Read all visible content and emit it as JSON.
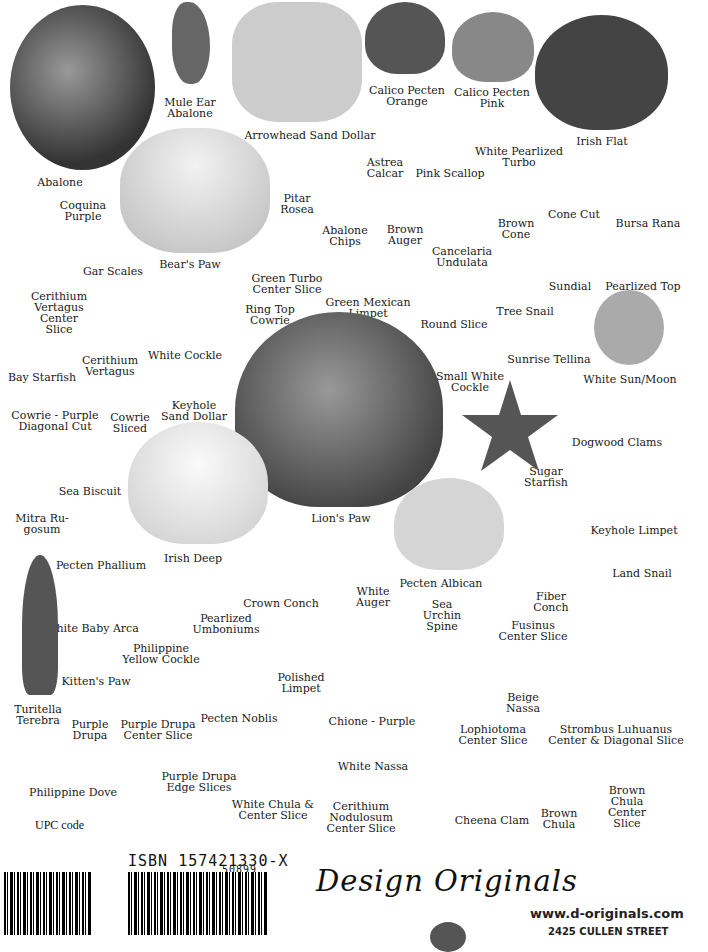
{
  "shells": [
    {
      "label": "Abalone",
      "x": 60,
      "y": 177
    },
    {
      "label": "Mule Ear\nAbalone",
      "x": 190,
      "y": 97
    },
    {
      "label": "Arrowhead Sand Dollar",
      "x": 310,
      "y": 130
    },
    {
      "label": "Calico Pecten\nOrange",
      "x": 407,
      "y": 85
    },
    {
      "label": "Calico Pecten\nPink",
      "x": 492,
      "y": 87
    },
    {
      "label": "Irish Flat",
      "x": 602,
      "y": 136
    },
    {
      "label": "Astrea\nCalcar",
      "x": 385,
      "y": 157
    },
    {
      "label": "White Pearlized\nTurbo",
      "x": 519,
      "y": 146
    },
    {
      "label": "Pink Scallop",
      "x": 450,
      "y": 168
    },
    {
      "label": "Coquina\nPurple",
      "x": 83,
      "y": 200
    },
    {
      "label": "Pitar\nRosea",
      "x": 297,
      "y": 193
    },
    {
      "label": "Abalone\nChips",
      "x": 345,
      "y": 225
    },
    {
      "label": "Brown\nAuger",
      "x": 405,
      "y": 224
    },
    {
      "label": "Brown\nCone",
      "x": 516,
      "y": 218
    },
    {
      "label": "Cone Cut",
      "x": 574,
      "y": 209
    },
    {
      "label": "Bursa Rana",
      "x": 648,
      "y": 218
    },
    {
      "label": "Cancelaria\nUndulata",
      "x": 462,
      "y": 246
    },
    {
      "label": "Bear's Paw",
      "x": 190,
      "y": 259
    },
    {
      "label": "Gar Scales",
      "x": 113,
      "y": 266
    },
    {
      "label": "Green Turbo\nCenter Slice",
      "x": 287,
      "y": 273
    },
    {
      "label": "Sundial",
      "x": 570,
      "y": 281
    },
    {
      "label": "Pearlized Top",
      "x": 643,
      "y": 281
    },
    {
      "label": "Cerithium\nVertagus\nCenter\nSlice",
      "x": 59,
      "y": 291
    },
    {
      "label": "Green Mexican\nLimpet",
      "x": 368,
      "y": 297
    },
    {
      "label": "Ring Top\nCowrie",
      "x": 270,
      "y": 304
    },
    {
      "label": "Tree Snail",
      "x": 525,
      "y": 306
    },
    {
      "label": "Round Slice",
      "x": 454,
      "y": 319
    },
    {
      "label": "White Cockle",
      "x": 185,
      "y": 350
    },
    {
      "label": "Cerithium\nVertagus",
      "x": 110,
      "y": 355
    },
    {
      "label": "Small White\nCockle",
      "x": 470,
      "y": 371
    },
    {
      "label": "Sunrise Tellina",
      "x": 549,
      "y": 354
    },
    {
      "label": "Bay Starfish",
      "x": 42,
      "y": 372
    },
    {
      "label": "White Sun/Moon",
      "x": 630,
      "y": 374
    },
    {
      "label": "Keyhole\nSand Dollar",
      "x": 194,
      "y": 400
    },
    {
      "label": "Cowrie - Purple\nDiagonal Cut",
      "x": 55,
      "y": 410
    },
    {
      "label": "Cowrie\nSliced",
      "x": 130,
      "y": 412
    },
    {
      "label": "Dogwood Clams",
      "x": 617,
      "y": 437
    },
    {
      "label": "Sugar\nStarfish",
      "x": 546,
      "y": 466
    },
    {
      "label": "Sea Biscuit",
      "x": 90,
      "y": 486
    },
    {
      "label": "Mitra Ru-\ngosum",
      "x": 42,
      "y": 513
    },
    {
      "label": "Lion's Paw",
      "x": 341,
      "y": 513
    },
    {
      "label": "Keyhole Limpet",
      "x": 634,
      "y": 525
    },
    {
      "label": "Irish Deep",
      "x": 193,
      "y": 553
    },
    {
      "label": "Pecten Phallium",
      "x": 101,
      "y": 560
    },
    {
      "label": "Land Snail",
      "x": 642,
      "y": 568
    },
    {
      "label": "Pecten Albican",
      "x": 441,
      "y": 578
    },
    {
      "label": "White\nAuger",
      "x": 373,
      "y": 586
    },
    {
      "label": "Crown Conch",
      "x": 281,
      "y": 598
    },
    {
      "label": "Fiber\nConch",
      "x": 551,
      "y": 591
    },
    {
      "label": "Sea\nUrchin\nSpine",
      "x": 442,
      "y": 599
    },
    {
      "label": "White Baby Arca",
      "x": 92,
      "y": 623
    },
    {
      "label": "Fusinus\nCenter Slice",
      "x": 533,
      "y": 620
    },
    {
      "label": "Pearlized\nUmboniums",
      "x": 226,
      "y": 613
    },
    {
      "label": "Philippine\nYellow Cockle",
      "x": 161,
      "y": 643
    },
    {
      "label": "Kitten's Paw",
      "x": 96,
      "y": 676
    },
    {
      "label": "Polished\nLimpet",
      "x": 301,
      "y": 672
    },
    {
      "label": "Beige\nNassa",
      "x": 523,
      "y": 692
    },
    {
      "label": "Turitella\nTerebra",
      "x": 38,
      "y": 704
    },
    {
      "label": "Purple\nDrupa",
      "x": 90,
      "y": 719
    },
    {
      "label": "Purple Drupa\nCenter Slice",
      "x": 158,
      "y": 719
    },
    {
      "label": "Pecten Noblis",
      "x": 239,
      "y": 713
    },
    {
      "label": "Chione - Purple",
      "x": 372,
      "y": 716
    },
    {
      "label": "Lophiotoma\nCenter Slice",
      "x": 493,
      "y": 724
    },
    {
      "label": "Strombus Luhuanus\nCenter & Diagonal Slice",
      "x": 616,
      "y": 724
    },
    {
      "label": "White Nassa",
      "x": 373,
      "y": 761
    },
    {
      "label": "Purple Drupa\nEdge Slices",
      "x": 199,
      "y": 771
    },
    {
      "label": "Philippine Dove",
      "x": 73,
      "y": 787
    },
    {
      "label": "White Chula &\nCenter Slice",
      "x": 273,
      "y": 799
    },
    {
      "label": "Cerithium\nNodulosum\nCenter Slice",
      "x": 361,
      "y": 801
    },
    {
      "label": "Brown\nChula\nCenter\nSlice",
      "x": 627,
      "y": 785
    },
    {
      "label": "Cheena Clam",
      "x": 492,
      "y": 815
    },
    {
      "label": "Brown\nChula",
      "x": 559,
      "y": 808
    }
  ],
  "footer": {
    "upc_label": "UPC code",
    "isbn": "ISBN 157421330-X",
    "isbn_addon": "50899",
    "brand": "Design Originals",
    "url": "www.d-originals.com",
    "address": "2425 CULLEN STREET"
  }
}
